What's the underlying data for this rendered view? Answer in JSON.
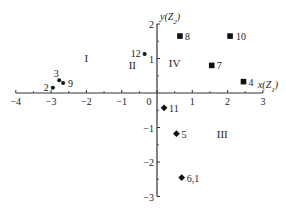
{
  "chart_data": {
    "type": "scatter",
    "title": "",
    "xlabel": "x(Z1)",
    "ylabel": "y(Z2)",
    "xlim": [
      -4,
      3
    ],
    "ylim": [
      -3,
      2
    ],
    "grid": false,
    "legend": null,
    "x_ticks": [
      -4,
      -3,
      -2,
      -1,
      0,
      1,
      2,
      3
    ],
    "y_ticks": [
      -3,
      -2,
      -1,
      1,
      2
    ],
    "x_tick_labels": [
      "−4",
      "−3",
      "−2",
      "−1",
      "0",
      "1",
      "2",
      "3"
    ],
    "y_tick_labels": [
      "−3",
      "−2",
      "−1",
      "1",
      "2"
    ],
    "region_labels": [
      {
        "label": "I",
        "x": -2.0,
        "y": 0.9
      },
      {
        "label": "II",
        "x": -0.7,
        "y": 0.7
      },
      {
        "label": "III",
        "x": 1.85,
        "y": -1.3
      },
      {
        "label": "IV",
        "x": 0.5,
        "y": 0.75
      }
    ],
    "series": [
      {
        "name": "circle",
        "marker": "circle",
        "points": [
          {
            "label": "2",
            "x": -2.95,
            "y": 0.15
          },
          {
            "label": "3",
            "x": -2.77,
            "y": 0.37
          },
          {
            "label": "9",
            "x": -2.66,
            "y": 0.29
          },
          {
            "label": "12",
            "x": -0.35,
            "y": 1.13
          }
        ]
      },
      {
        "name": "square",
        "marker": "square",
        "points": [
          {
            "label": "8",
            "x": 0.65,
            "y": 1.65
          },
          {
            "label": "10",
            "x": 2.07,
            "y": 1.65
          },
          {
            "label": "7",
            "x": 1.55,
            "y": 0.8
          },
          {
            "label": "4",
            "x": 2.45,
            "y": 0.33
          }
        ]
      },
      {
        "name": "diamond",
        "marker": "diamond",
        "points": [
          {
            "label": "11",
            "x": 0.2,
            "y": -0.43
          },
          {
            "label": "5",
            "x": 0.55,
            "y": -1.18
          },
          {
            "label": "6,1",
            "x": 0.7,
            "y": -2.45
          }
        ]
      }
    ]
  }
}
